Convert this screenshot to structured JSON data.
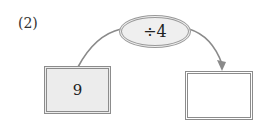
{
  "problem": {
    "label": "(2)"
  },
  "operation": {
    "text": "÷4",
    "operator": "÷",
    "operand": 4
  },
  "input_box": {
    "value": "9"
  },
  "output_box": {
    "value": ""
  },
  "colors": {
    "stroke": "#8c8c8c",
    "input_fill": "#ececec",
    "ellipse_fill": "#efefef"
  }
}
